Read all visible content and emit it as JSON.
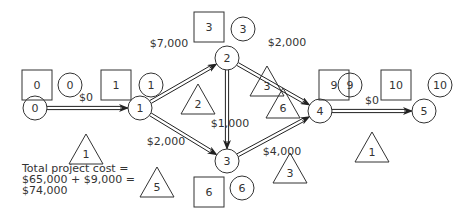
{
  "nodes": [
    {
      "id": "0",
      "label": "0"
    },
    {
      "id": "1",
      "label": "1"
    },
    {
      "id": "2",
      "label": "2"
    },
    {
      "id": "3",
      "label": "3"
    },
    {
      "id": "4",
      "label": "4"
    },
    {
      "id": "5",
      "label": "5"
    }
  ],
  "edges": [
    {
      "from": "0",
      "to": "1",
      "cost": "$0",
      "duration": "1"
    },
    {
      "from": "1",
      "to": "2",
      "cost": "$7,000",
      "duration": "2"
    },
    {
      "from": "1",
      "to": "3",
      "cost": "$2,000",
      "duration": "5"
    },
    {
      "from": "2",
      "to": "3",
      "cost": "$1,000",
      "duration": "3"
    },
    {
      "from": "2",
      "to": "4",
      "cost": "$2,000",
      "duration": "6"
    },
    {
      "from": "3",
      "to": "4",
      "cost": "$4,000",
      "duration": "3"
    },
    {
      "from": "4",
      "to": "5",
      "cost": "$0",
      "duration": "1"
    }
  ],
  "node_times": [
    {
      "node": "0",
      "square": "0",
      "circle": "0"
    },
    {
      "node": "1",
      "square": "1",
      "circle": "1"
    },
    {
      "node": "2",
      "square": "3",
      "circle": "3"
    },
    {
      "node": "3",
      "square": "6",
      "circle": "6"
    },
    {
      "node": "4",
      "square": "9",
      "circle": "9"
    },
    {
      "node": "5",
      "square": "10",
      "circle": "10"
    }
  ],
  "total": {
    "line1": "Total project cost =",
    "line2": "$65,000 + $9,000 =",
    "line3": "$74,000"
  }
}
